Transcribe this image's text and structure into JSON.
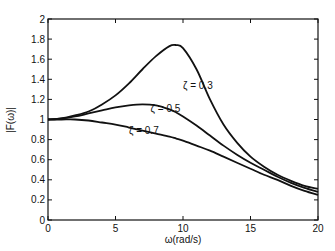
{
  "chart_data": {
    "type": "line",
    "title": "",
    "xlabel": "ω(rad/s)",
    "ylabel": "|F(ω)|",
    "xlim": [
      0,
      20
    ],
    "ylim": [
      0,
      2
    ],
    "xticks": [
      0,
      5,
      10,
      15,
      20
    ],
    "yticks": [
      0,
      0.2,
      0.4,
      0.6,
      0.8,
      1,
      1.2,
      1.4,
      1.6,
      1.8,
      2
    ],
    "ytick_labels": [
      "0",
      "0.2",
      "0.4",
      "0.6",
      "0.8",
      "1",
      "1.2",
      "1.4",
      "1.6",
      "1.8",
      "2"
    ],
    "grid": false,
    "legend": "none (inline annotations)",
    "x": [
      0,
      1,
      2,
      3,
      4,
      5,
      6,
      7,
      8,
      9,
      9.5,
      10,
      11,
      12,
      13,
      14,
      15,
      16,
      17,
      18,
      19,
      20
    ],
    "series": [
      {
        "name": "ζ = 0.3",
        "values": [
          1.0,
          1.01,
          1.04,
          1.08,
          1.15,
          1.24,
          1.36,
          1.5,
          1.63,
          1.73,
          1.74,
          1.71,
          1.5,
          1.2,
          0.95,
          0.77,
          0.63,
          0.53,
          0.45,
          0.39,
          0.34,
          0.31
        ]
      },
      {
        "name": "ζ = 0.5",
        "values": [
          1.0,
          1.01,
          1.03,
          1.06,
          1.09,
          1.12,
          1.14,
          1.15,
          1.14,
          1.1,
          1.07,
          1.03,
          0.94,
          0.84,
          0.74,
          0.65,
          0.57,
          0.5,
          0.43,
          0.37,
          0.32,
          0.28
        ]
      },
      {
        "name": "ζ = 0.7",
        "values": [
          1.0,
          1.0,
          1.0,
          0.99,
          0.97,
          0.95,
          0.92,
          0.89,
          0.86,
          0.83,
          0.81,
          0.79,
          0.74,
          0.69,
          0.63,
          0.57,
          0.51,
          0.45,
          0.4,
          0.34,
          0.29,
          0.25
        ]
      }
    ],
    "annotations": [
      {
        "text": "ζ = 0.3",
        "x": 10.0,
        "y": 1.3
      },
      {
        "text": "ζ = 0.5",
        "x": 7.6,
        "y": 1.07
      },
      {
        "text": "ζ = 0.7",
        "x": 6.0,
        "y": 0.86
      }
    ]
  }
}
